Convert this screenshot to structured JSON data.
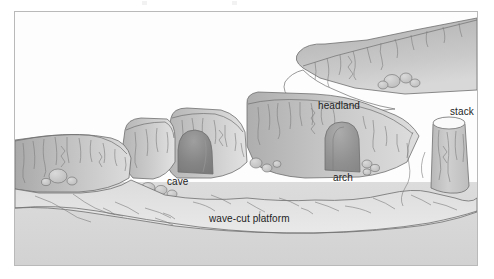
{
  "figure": {
    "frame": {
      "border_color": "#b9b9b9",
      "background_color": "#fcfcfc"
    }
  },
  "labels": {
    "cave": "cave",
    "arch": "arch",
    "headland": "headland",
    "stack": "stack",
    "wave_cut_platform": "wave-cut platform"
  },
  "palette": {
    "sky": "#fdfdfd",
    "sea": "#d9d9d9",
    "platform_light": "#e3e3e3",
    "cliff_face_light": "#d3d3d3",
    "cliff_face_mid": "#bdbdbd",
    "cliff_face_dark": "#a8a8a8",
    "cliff_top": "#cfcfcf",
    "cave_interior": "#8d8d8d",
    "arch_interior": "#9a9a9a",
    "stack_body": "#c6c6c6",
    "stack_top": "#fafafa",
    "boulder": "#c9c9c9",
    "outline": "#6f6f6f",
    "crack": "#7c7c7c",
    "label_text": "#1d1d1d"
  },
  "features": [
    {
      "name": "cave",
      "description": "dark arched opening at base of cliff, left-of-centre"
    },
    {
      "name": "arch",
      "description": "through-opening in headland, right-of-centre"
    },
    {
      "name": "headland",
      "description": "promontory of rock projecting seaward, upper right"
    },
    {
      "name": "stack",
      "description": "isolated pillar of rock standing offshore, far right"
    },
    {
      "name": "wave-cut platform",
      "description": "flat rock surface at base of cliffs, foreground"
    }
  ]
}
